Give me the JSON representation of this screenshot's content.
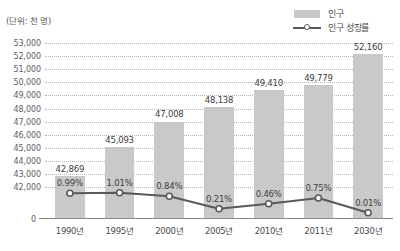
{
  "caption": {
    "unit": "(단위: 천 명)"
  },
  "legend": {
    "position": "top-right",
    "items": [
      {
        "label": "인구",
        "marker": "bar-swatch-icon",
        "color": "#c9c9c9"
      },
      {
        "label": "인구 성장률",
        "marker": "line-marker-icon",
        "color": "#595959"
      }
    ]
  },
  "axes": {
    "zero_tick": "0",
    "y_ticks": [
      "53,000",
      "52,000",
      "51,000",
      "50,000",
      "49,000",
      "48,000",
      "47,000",
      "46,000",
      "45,000",
      "44,000",
      "43,000",
      "42,000"
    ],
    "x_ticks": [
      "1990년",
      "1995년",
      "2000년",
      "2005년",
      "2010년",
      "2011년",
      "2030년"
    ]
  },
  "chart_data": {
    "type": "bar",
    "title": "",
    "subtitle": "",
    "xlabel": "",
    "ylabel": "(단위: 천 명)",
    "grid": true,
    "legend_position": "top-right",
    "categories": [
      "1990년",
      "1995년",
      "2000년",
      "2005년",
      "2010년",
      "2011년",
      "2030년"
    ],
    "series": [
      {
        "name": "인구",
        "type": "bar",
        "unit": "천 명",
        "color": "#c9c9c9",
        "values": [
          42869,
          45093,
          47008,
          48138,
          49410,
          49779,
          52160
        ],
        "labels": [
          "42,869",
          "45,093",
          "47,008",
          "48,138",
          "49,410",
          "49,779",
          "52,160"
        ],
        "ylim": [
          42000,
          53000
        ],
        "ytick_step": 1000
      },
      {
        "name": "인구 성장률",
        "type": "line",
        "unit": "%",
        "color": "#595959",
        "marker": "circle-open",
        "values": [
          0.99,
          1.01,
          0.84,
          0.21,
          0.46,
          0.75,
          0.01
        ],
        "labels": [
          "0.99%",
          "1.01%",
          "0.84%",
          "0.21%",
          "0.46%",
          "0.75%",
          "0.01%"
        ]
      }
    ]
  }
}
